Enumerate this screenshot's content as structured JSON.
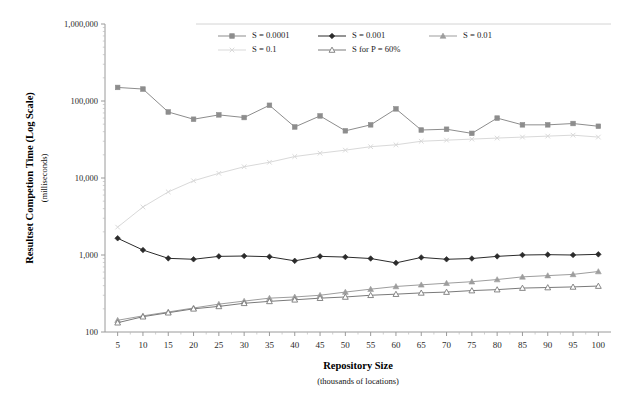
{
  "chart_data": {
    "type": "line",
    "title": "",
    "xlabel": "Repository Size",
    "xlabel_sub": "(thousands of locations)",
    "ylabel": "Resultset Competion Time (Log Scale)",
    "ylabel_sub": "(milliseconds)",
    "yscale": "log",
    "ylim": [
      100,
      1000000
    ],
    "ytick_labels": [
      "1,000,000",
      "100,000",
      "10,000",
      "1,000",
      "100"
    ],
    "ytick_values": [
      1000000,
      100000,
      10000,
      1000,
      100
    ],
    "grid": false,
    "legend_position": "top-right",
    "x": [
      5,
      10,
      15,
      20,
      25,
      30,
      35,
      40,
      45,
      50,
      55,
      60,
      65,
      70,
      75,
      80,
      85,
      90,
      95,
      100
    ],
    "xtick_labels": [
      "5",
      "10",
      "15",
      "20",
      "25",
      "30",
      "35",
      "40",
      "45",
      "50",
      "55",
      "60",
      "65",
      "70",
      "75",
      "80",
      "85",
      "90",
      "95",
      "100"
    ],
    "series": [
      {
        "name": "S = 0.0001",
        "color": "#8d8d8d",
        "marker": "square",
        "values": [
          150000,
          143000,
          72000,
          58000,
          66000,
          61000,
          88000,
          46000,
          64000,
          41000,
          49000,
          79000,
          42000,
          43000,
          38000,
          60000,
          49000,
          49000,
          51000,
          47000
        ]
      },
      {
        "name": "S = 0.001",
        "color": "#2b2b2b",
        "marker": "diamond",
        "values": [
          1650,
          1160,
          905,
          880,
          960,
          970,
          950,
          840,
          960,
          940,
          900,
          790,
          930,
          880,
          900,
          960,
          1000,
          1010,
          1000,
          1020
        ]
      },
      {
        "name": "S = 0.01",
        "color": "#9d9d9d",
        "marker": "triangle",
        "values": [
          142,
          162,
          182,
          205,
          230,
          252,
          275,
          285,
          300,
          330,
          360,
          390,
          410,
          430,
          450,
          480,
          520,
          540,
          560,
          610
        ]
      },
      {
        "name": "S = 0.1",
        "color": "#d9d9d9",
        "marker": "cross",
        "values": [
          2300,
          4200,
          6600,
          9200,
          11500,
          14000,
          16000,
          19000,
          21000,
          23000,
          25500,
          27000,
          30000,
          31000,
          32000,
          33000,
          34000,
          35000,
          36000,
          34000
        ]
      },
      {
        "name": "S for P = 60%",
        "color": "#7a7a7a",
        "marker": "open-triangle",
        "values": [
          132,
          158,
          178,
          200,
          215,
          236,
          250,
          262,
          275,
          285,
          300,
          310,
          322,
          330,
          345,
          355,
          372,
          378,
          385,
          395
        ]
      }
    ]
  },
  "legend": {
    "items": [
      {
        "label": "S = 0.0001"
      },
      {
        "label": "S = 0.001"
      },
      {
        "label": "S = 0.01"
      },
      {
        "label": "S = 0.1"
      },
      {
        "label": "S for P = 60%"
      }
    ]
  }
}
